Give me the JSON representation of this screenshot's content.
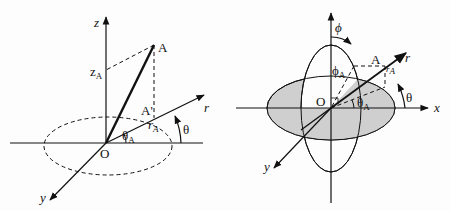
{
  "left_diagram": {
    "title": "cylindrical coordinates",
    "labels": {
      "z_axis": "z",
      "point": "A",
      "z_coord": "z",
      "z_coord_sub": "A",
      "projection": "A'",
      "r_axis": "r",
      "r_coord": "r",
      "r_coord_sub": "A",
      "theta": "θ",
      "theta_a": "θ",
      "theta_a_sub": "A",
      "origin": "O",
      "y_axis": "y"
    }
  },
  "right_diagram": {
    "title": "spherical coordinates",
    "labels": {
      "phi": "ϕ",
      "phi_a": "ϕ",
      "phi_a_sub": "A",
      "point": "A",
      "r_axis": "r",
      "r_coord": "r",
      "r_coord_sub": "A",
      "theta": "θ",
      "theta_a": "θ",
      "theta_a_sub": "A",
      "origin": "O",
      "x_axis": "x",
      "y_axis": "y"
    },
    "colors": {
      "shaded_plane": "#cfcfcf"
    }
  },
  "colors": {
    "ink": "#111111",
    "background": "#fdfdfd"
  }
}
